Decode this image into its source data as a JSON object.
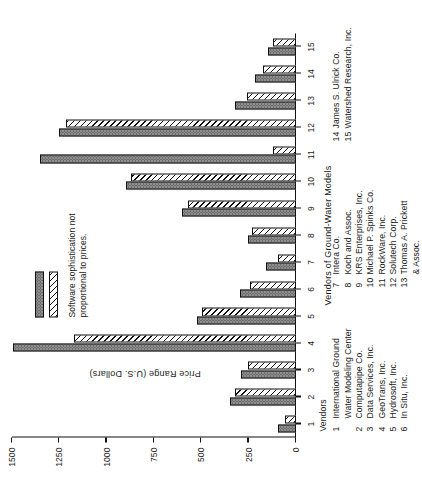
{
  "chart_data": {
    "type": "bar",
    "title": "",
    "orientation": "vertical-rotated",
    "xlabel": "Vendors of Ground-Water Models",
    "ylabel": "Price Range (U.S. Dollars)",
    "categories": [
      "1",
      "2",
      "3",
      "4",
      "5",
      "6",
      "7",
      "8",
      "9",
      "10",
      "11",
      "12",
      "13",
      "14",
      "15"
    ],
    "ylim": [
      0,
      1500
    ],
    "yticks": [
      0,
      250,
      500,
      750,
      1000,
      1250,
      1500
    ],
    "ytick_labels": [
      "0",
      "250",
      "500",
      "750",
      "1000",
      "1250",
      "1500"
    ],
    "grid": false,
    "legend_position": "upper-left-inside",
    "series": [
      {
        "name": "Maximum",
        "fill": "stippled-gray",
        "values": [
          95,
          350,
          290,
          1495,
          525,
          295,
          160,
          255,
          600,
          900,
          1350,
          1250,
          320,
          215,
          150
        ]
      },
      {
        "name": "Minimum",
        "fill": "diagonal-hatch",
        "values": [
          60,
          320,
          255,
          1175,
          495,
          245,
          95,
          230,
          570,
          870,
          120,
          1215,
          260,
          175,
          120
        ]
      }
    ],
    "annotation": "Software sophistication not proportional to prices."
  },
  "legend": {
    "entries": [
      {
        "label": "Maximum"
      },
      {
        "label": "Minimum"
      }
    ],
    "note": "Software sophistication not proportional to prices."
  },
  "axes": {
    "value_axis_title": "Price Range (U.S. Dollars)",
    "category_axis_title": "Vendors of Ground-Water Models",
    "value_ticks": [
      "1500",
      "1250",
      "1000",
      "750",
      "500",
      "250",
      "0"
    ],
    "category_ticks": [
      "1",
      "2",
      "3",
      "4",
      "5",
      "6",
      "7",
      "8",
      "9",
      "10",
      "11",
      "12",
      "13",
      "14",
      "15"
    ]
  },
  "vendor_key": {
    "title": "Vendors",
    "columns": [
      {
        "heading": "Vendors",
        "entries": [
          {
            "num": "1",
            "name": "International Ground\nWater Modeling Center"
          },
          {
            "num": "2",
            "name": "Computapipe Co."
          },
          {
            "num": "3",
            "name": "Data Services, Inc."
          },
          {
            "num": "4",
            "name": "GeoTrans, Inc."
          },
          {
            "num": "5",
            "name": "Hydrosoft, Inc."
          },
          {
            "num": "6",
            "name": "In Situ, Inc."
          }
        ]
      },
      {
        "heading": "",
        "entries": [
          {
            "num": "7",
            "name": "Intera Co."
          },
          {
            "num": "8",
            "name": "Koch and Assoc."
          },
          {
            "num": "9",
            "name": "KRS Enterprises, Inc."
          },
          {
            "num": "10",
            "name": "Michael P. Spinks Co."
          },
          {
            "num": "11",
            "name": "RockWare, Inc."
          },
          {
            "num": "12",
            "name": "Solutech Corp."
          },
          {
            "num": "13",
            "name": "Thomas A. Prickett\n  & Assoc."
          }
        ]
      },
      {
        "heading": "",
        "entries": [
          {
            "num": "14",
            "name": "James S. Ulrick Co."
          },
          {
            "num": "15",
            "name": "Watershed Research, Inc."
          }
        ]
      }
    ]
  },
  "colors": {
    "maximum_fill": "#8f8f8f",
    "minimum_fill": "#ffffff",
    "outline": "#111111",
    "background": "#ffffff"
  }
}
